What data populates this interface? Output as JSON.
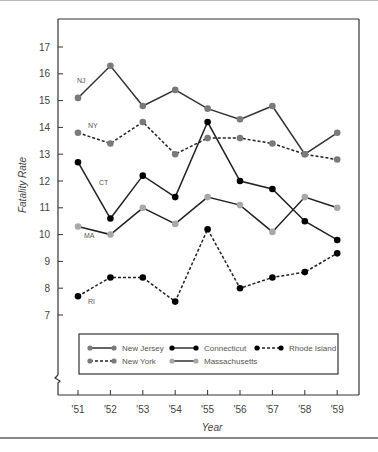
{
  "chart_data": {
    "type": "line",
    "title": "",
    "xlabel": "Year",
    "ylabel": "Fatality Rate",
    "x": [
      "'51",
      "'52",
      "'53",
      "'54",
      "'55",
      "'56",
      "'57",
      "'58",
      "'59"
    ],
    "yticks": [
      7,
      8,
      9,
      10,
      11,
      12,
      13,
      14,
      15,
      16,
      17
    ],
    "ylim": [
      7,
      17
    ],
    "y_axis_break": true,
    "grid": false,
    "legend_position": "inside-bottom",
    "series": [
      {
        "name": "New Jersey",
        "short": "NJ",
        "style": "solid",
        "color": "#6e6e6e",
        "marker": "#7a7a7a",
        "values": [
          15.1,
          16.3,
          14.8,
          15.4,
          14.7,
          14.3,
          14.8,
          13.0,
          13.8
        ]
      },
      {
        "name": "New York",
        "short": "NY",
        "style": "dashed",
        "color": "#222222",
        "marker": "#7a7a7a",
        "values": [
          13.8,
          13.4,
          14.2,
          13.0,
          13.6,
          13.6,
          13.4,
          13.0,
          12.8
        ]
      },
      {
        "name": "Connecticut",
        "short": "CT",
        "style": "solid",
        "color": "#222222",
        "marker": "#000000",
        "values": [
          12.7,
          10.6,
          12.2,
          11.4,
          14.2,
          12.0,
          11.7,
          10.5,
          9.8
        ]
      },
      {
        "name": "Massachusetts",
        "short": "MA",
        "style": "solid",
        "color": "#222222",
        "marker": "#a8a8a8",
        "values": [
          10.3,
          10.0,
          11.0,
          10.4,
          11.4,
          11.1,
          10.1,
          11.4,
          11.0
        ]
      },
      {
        "name": "Rhode Island",
        "short": "RI",
        "style": "dashed",
        "color": "#222222",
        "marker": "#000000",
        "values": [
          7.7,
          8.4,
          8.4,
          7.5,
          10.2,
          8.0,
          8.4,
          8.6,
          9.3
        ]
      }
    ],
    "legend": [
      [
        "New Jersey",
        "Connecticut",
        "Rhode Island"
      ],
      [
        "New York",
        "Massachusetts"
      ]
    ]
  }
}
